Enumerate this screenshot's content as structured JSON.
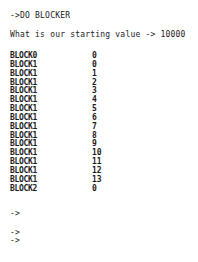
{
  "terminal": {
    "command_line": "->DO BLOCKER",
    "question_line": "What is our starting value -> 10000",
    "blocks": [
      {
        "name": "BLOCK0",
        "value": "0"
      },
      {
        "name": "BLOCK1",
        "value": "0"
      },
      {
        "name": "BLOCK1",
        "value": "1"
      },
      {
        "name": "BLOCK1",
        "value": "2"
      },
      {
        "name": "BLOCK1",
        "value": "3"
      },
      {
        "name": "BLOCK1",
        "value": "4"
      },
      {
        "name": "BLOCK1",
        "value": "5"
      },
      {
        "name": "BLOCK1",
        "value": "6"
      },
      {
        "name": "BLOCK1",
        "value": "7"
      },
      {
        "name": "BLOCK1",
        "value": "8"
      },
      {
        "name": "BLOCK1",
        "value": "9"
      },
      {
        "name": "BLOCK1",
        "value": "10"
      },
      {
        "name": "BLOCK1",
        "value": "11"
      },
      {
        "name": "BLOCK1",
        "value": "12"
      },
      {
        "name": "BLOCK1",
        "value": "13"
      },
      {
        "name": "BLOCK2",
        "value": "0"
      }
    ],
    "prompts": [
      "->",
      "->",
      "->"
    ]
  }
}
